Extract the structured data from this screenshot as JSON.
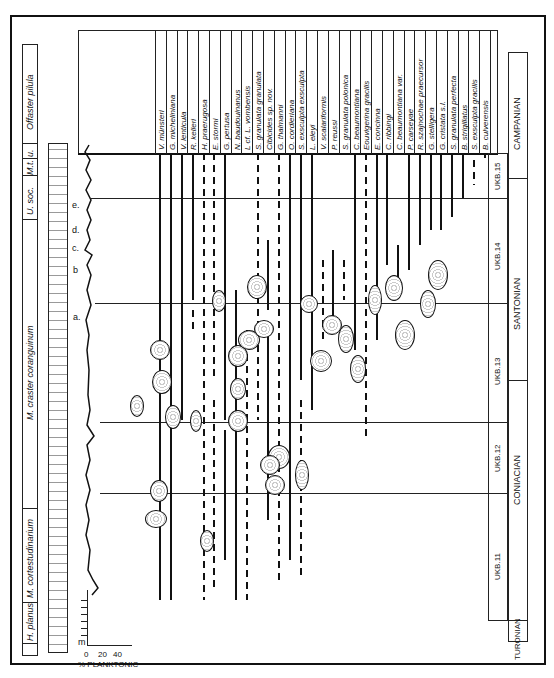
{
  "chart_data": {
    "type": "range-chart",
    "orientation": "rotated-90",
    "stages": [
      {
        "name": "TURONIAN"
      },
      {
        "name": "CONIACIAN"
      },
      {
        "name": "SANTONIAN"
      },
      {
        "name": "CAMPANIAN"
      }
    ],
    "ukb_zones": [
      "UKB.11",
      "UKB.12",
      "UKB.13",
      "UKB.14",
      "UKB.15"
    ],
    "macrofossil_zones": [
      "H. planus",
      "M. cortestudinarium",
      "M. coranguinum",
      "U. soc.",
      "M.t.",
      "u.",
      "Offaster pilula"
    ],
    "macrofossil_zone_label_coranguinum": "M. craster coranguinum",
    "marker_beds": [
      "a",
      "b",
      "c",
      "d",
      "e"
    ],
    "planktonic_axis": {
      "label": "% PLANKTONIC",
      "ticks": [
        "0",
        "20",
        "40"
      ],
      "depth_unit": "m"
    },
    "species": [
      "V. münsteri",
      "G. micheliniana",
      "V. lenticula",
      "R. kelleri",
      "H. praerugosa",
      "E. stormi",
      "G. pertusa",
      "N. baudouinanus",
      "L cf. L. vombensis",
      "S. granulata granulata",
      "Cibicides sp. nov.",
      "G. thalmanni",
      "O. cordieriana",
      "S. exsculpta exsculpta",
      "L. eleyi",
      "V. scalariformis",
      "P. reussi",
      "S. granulata polonica",
      "C. beaumontiana",
      "Eouvigerina gracilis",
      "E. concinna",
      "C. ribbingi",
      "C. beaumontiana var.",
      "P. carseyae",
      "R. szajnochae praecursor",
      "G. stelligera",
      "G. cristata s.l.",
      "S. granulata perfecta",
      "B. strigillatus",
      "S. exsculpta gracilis",
      "B. culverensis"
    ]
  },
  "labels": {
    "percent_planktonic": "% PLANKTONIC",
    "m": "m",
    "t0": "0",
    "t20": "20",
    "t40": "40",
    "bed_a": "a.",
    "bed_b": "b",
    "bed_c": "c.",
    "bed_d": "d.",
    "bed_e": "e.",
    "zone_hplanus": "H. planus",
    "zone_cortest": "M. cortestudinarium",
    "zone_coranguinum": "M. craster coranguinum",
    "zone_usoc": "U. soc.",
    "zone_mt": "M.t.",
    "zone_u": "u.",
    "zone_offaster": "Offaster pilula",
    "ukb11": "UKB.11",
    "ukb12": "UKB.12",
    "ukb13": "UKB.13",
    "ukb14": "UKB.14",
    "ukb15": "UKB.15",
    "turonian": "TURONIAN",
    "coniacian": "CONIACIAN",
    "santonian": "SANTONIAN",
    "campanian": "CAMPANIAN"
  }
}
